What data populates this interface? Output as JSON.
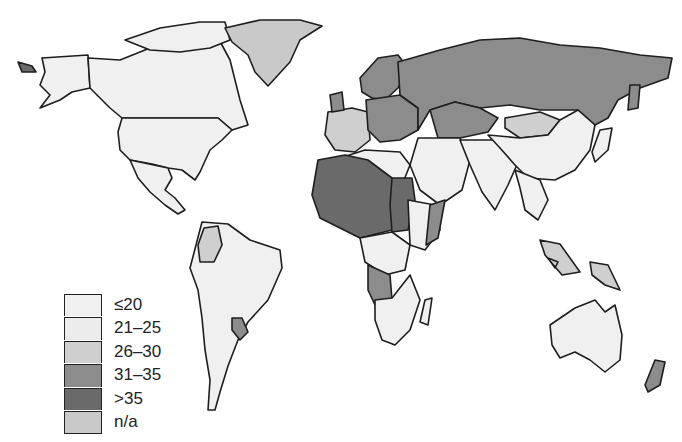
{
  "map": {
    "type": "choropleth",
    "title": "",
    "projection": "world",
    "style": "grayscale",
    "categories": [
      {
        "key": "le20",
        "label": "≤20",
        "color": "#f0f0f0"
      },
      {
        "key": "21_25",
        "label": "21–25",
        "color": "#ececec"
      },
      {
        "key": "26_30",
        "label": "26–30",
        "color": "#cfcfcf"
      },
      {
        "key": "31_35",
        "label": "31–35",
        "color": "#8c8c8c"
      },
      {
        "key": "gt35",
        "label": ">35",
        "color": "#6a6a6a"
      },
      {
        "key": "na",
        "label": "n/a",
        "color": "#c9c9c9"
      }
    ],
    "regions": [
      {
        "name": "North America (USA, Canada)",
        "class": "le20"
      },
      {
        "name": "Greenland",
        "class": "na"
      },
      {
        "name": "Mexico / Central America",
        "class": "le20"
      },
      {
        "name": "South America",
        "class": "le20"
      },
      {
        "name": "Colombia",
        "class": "26_30"
      },
      {
        "name": "Paraguay",
        "class": "31_35"
      },
      {
        "name": "Western Europe",
        "class": "26_30"
      },
      {
        "name": "Central / Eastern Europe",
        "class": "31_35"
      },
      {
        "name": "Russia",
        "class": "31_35"
      },
      {
        "name": "Kazakhstan",
        "class": "31_35"
      },
      {
        "name": "Mongolia",
        "class": "26_30"
      },
      {
        "name": "China / East Asia",
        "class": "le20"
      },
      {
        "name": "Middle East",
        "class": "le20"
      },
      {
        "name": "South Asia",
        "class": "le20"
      },
      {
        "name": "North / West Africa (Sahel)",
        "class": "gt35"
      },
      {
        "name": "Sudan / Chad",
        "class": "gt35"
      },
      {
        "name": "Southern Africa",
        "class": "le20"
      },
      {
        "name": "Angola / Zambia",
        "class": "31_35"
      },
      {
        "name": "Indonesia / SE Asia",
        "class": "26_30"
      },
      {
        "name": "Australia",
        "class": "le20"
      },
      {
        "name": "New Zealand",
        "class": "31_35"
      }
    ]
  },
  "legend": {
    "items": [
      {
        "label": "≤20",
        "color": "#f0f0f0"
      },
      {
        "label": "21–25",
        "color": "#ececec"
      },
      {
        "label": "26–30",
        "color": "#cfcfcf"
      },
      {
        "label": "31–35",
        "color": "#8c8c8c"
      },
      {
        "label": ">35",
        "color": "#6a6a6a"
      },
      {
        "label": "n/a",
        "color": "#c9c9c9"
      }
    ]
  }
}
